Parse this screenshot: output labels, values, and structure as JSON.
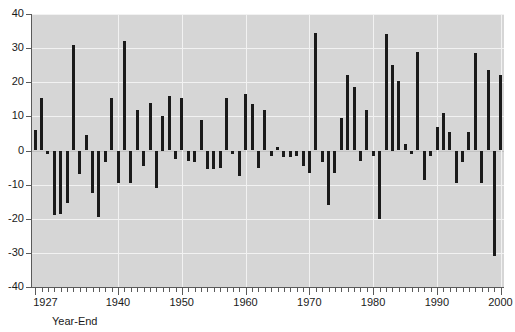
{
  "chart_data": {
    "type": "bar",
    "title": "",
    "subtitle": "",
    "xlabel": "Year-End",
    "ylabel": "",
    "ylim": [
      -40,
      40
    ],
    "ytick_values": [
      40,
      30,
      20,
      10,
      0,
      -10,
      -20,
      -30,
      -40
    ],
    "ytick_labels": [
      "40",
      "30",
      "20",
      "10",
      "0",
      "-10",
      "-20",
      "-30",
      "-40"
    ],
    "xlim": [
      1926.5,
      2000.5
    ],
    "xtick_labels": [
      "1927",
      "1940",
      "1950",
      "1960",
      "1970",
      "1980",
      "1990",
      "2000"
    ],
    "xtick_values": [
      1927,
      1940,
      1950,
      1960,
      1970,
      1980,
      1990,
      2000
    ],
    "minor_tick_step": 1,
    "grid": true,
    "grid_color": "#f2f2f2",
    "plot_bg": "#d6d6d6",
    "bar_color": "#1a1a1a",
    "legend": null,
    "categories": [
      1927,
      1928,
      1929,
      1930,
      1931,
      1932,
      1933,
      1934,
      1935,
      1936,
      1937,
      1938,
      1939,
      1940,
      1941,
      1942,
      1943,
      1944,
      1945,
      1946,
      1947,
      1948,
      1949,
      1950,
      1951,
      1952,
      1953,
      1954,
      1955,
      1956,
      1957,
      1958,
      1959,
      1960,
      1961,
      1962,
      1963,
      1964,
      1965,
      1966,
      1967,
      1968,
      1969,
      1970,
      1971,
      1972,
      1973,
      1974,
      1975,
      1976,
      1977,
      1978,
      1979,
      1980,
      1981,
      1982,
      1983,
      1984,
      1985,
      1986,
      1987,
      1988,
      1989,
      1990,
      1991,
      1992,
      1993,
      1994,
      1995,
      1996,
      1997,
      1998,
      1999,
      2000
    ],
    "values": [
      6,
      15.5,
      -1,
      -19,
      -18.5,
      -15.5,
      31,
      -7,
      4.5,
      -12.5,
      -19.5,
      -3.5,
      15.5,
      -9.5,
      32,
      -9.5,
      12,
      -4.5,
      14,
      -11,
      10,
      16,
      -2.5,
      15.5,
      -3,
      -3.5,
      9,
      -5.5,
      -5.5,
      -5,
      15.5,
      -1,
      -7.5,
      16.5,
      13.5,
      -5,
      12,
      -1.5,
      1,
      -2,
      -2,
      -1.5,
      -4.5,
      -6.5,
      34.5,
      -3.5,
      -16,
      -6.5,
      9.5,
      22,
      18.5,
      -3,
      12,
      -1.5,
      -20,
      34,
      25,
      20.5,
      2,
      -1,
      29,
      -8.5,
      -1.5,
      7,
      11,
      5.5,
      -9.5,
      -3.5,
      5.5,
      28.5,
      -9.5,
      23.5,
      -31,
      22
    ]
  }
}
